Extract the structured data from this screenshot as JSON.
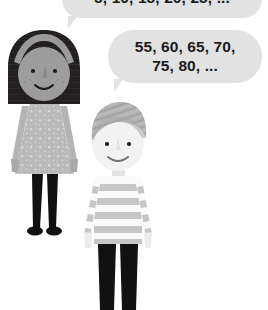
{
  "scene": {
    "title": "Two children counting aloud in multiples",
    "background_color": "#ffffff"
  },
  "speech_bubbles": [
    {
      "id": "girl-bubble",
      "speaker": "girl",
      "text": "5, 10, 15, 20, 25, ...",
      "fill_color": "#e2e2e2",
      "text_color": "#1b1b1b",
      "clipped_at_top": true
    },
    {
      "id": "boy-bubble",
      "speaker": "boy",
      "line_1": "55, 60, 65, 70,",
      "line_2": "75, 80, ...",
      "text": "55, 60, 65, 70, 75, 80, ...",
      "fill_color": "#e2e2e2",
      "text_color": "#1b1b1b"
    }
  ],
  "figures": [
    {
      "id": "girl",
      "label": "girl-character",
      "hair_color": "#231f20",
      "headband_color": "#9a9a9a",
      "skin_color": "#9d9d9d",
      "dress_color": "#b9b9b9",
      "dress_pattern": "speckled dots",
      "legs_color": "#111111",
      "shoes_color": "#111111"
    },
    {
      "id": "boy",
      "label": "boy-character",
      "hair_color": "#b0b0b0",
      "skin_color": "#f2f2f2",
      "shirt_stripe_light": "#fafafa",
      "shirt_stripe_dark": "#c6c6c6",
      "pants_color": "#111111"
    }
  ],
  "icons": {
    "girl_face": "smiling-face-icon",
    "boy_face": "smiling-face-icon",
    "bubble_tail": "speech-tail-icon"
  }
}
